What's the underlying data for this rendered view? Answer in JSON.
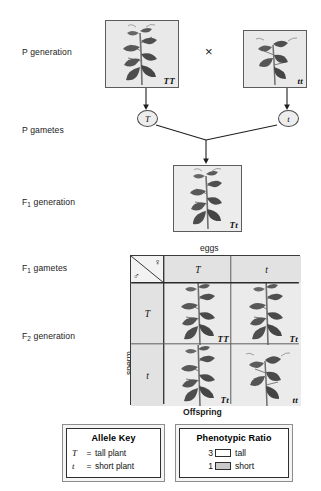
{
  "diagram": {
    "rows": [
      {
        "id": "p-generation",
        "label": "P generation"
      },
      {
        "id": "p-gametes",
        "label": "P gametes"
      },
      {
        "id": "f1-generation",
        "label": "F",
        "sub": "1",
        "label_tail": " generation"
      },
      {
        "id": "f1-gametes",
        "label": "F",
        "sub": "1",
        "label_tail": " gametes"
      },
      {
        "id": "f2-generation",
        "label": "F",
        "sub": "2",
        "label_tail": " generation"
      }
    ]
  },
  "p_generation": {
    "parent_left": {
      "genotype": "TT",
      "phenotype": "tall plant"
    },
    "parent_right": {
      "genotype": "tt",
      "phenotype": "short plant"
    },
    "cross_symbol": "×"
  },
  "p_gametes": {
    "left": "T",
    "right": "t"
  },
  "f1_generation": {
    "genotype": "Tt",
    "phenotype": "tall plant"
  },
  "punnett": {
    "top_axis_label": "eggs",
    "side_axis_label": "sperm",
    "bottom_axis_label": "Offspring",
    "female_symbol": "♀",
    "male_symbol": "♂",
    "egg_alleles": [
      "T",
      "t"
    ],
    "sperm_alleles": [
      "T",
      "t"
    ],
    "cells": [
      {
        "row": 0,
        "col": 0,
        "genotype": "TT",
        "phenotype": "tall"
      },
      {
        "row": 0,
        "col": 1,
        "genotype": "Tt",
        "phenotype": "tall"
      },
      {
        "row": 1,
        "col": 0,
        "genotype": "Tt",
        "phenotype": "tall"
      },
      {
        "row": 1,
        "col": 1,
        "genotype": "tt",
        "phenotype": "short"
      }
    ]
  },
  "allele_key": {
    "title": "Allele Key",
    "equals": "=",
    "entries": [
      {
        "symbol": "T",
        "meaning": "tall plant"
      },
      {
        "symbol": "t",
        "meaning": "short plant"
      }
    ]
  },
  "phenotypic_ratio": {
    "title": "Phenotypic Ratio",
    "entries": [
      {
        "count": "3",
        "label": "tall",
        "swatch_color": "#ffffff"
      },
      {
        "count": "1",
        "label": "short",
        "swatch_color": "#c9c9c9"
      }
    ]
  },
  "colors": {
    "box_fill": "#ebebeb",
    "header_fill": "#e2e2e2",
    "line": "#3a3a3a",
    "plant_dark": "#4a4a4a",
    "plant_mid": "#6f6f6f"
  }
}
